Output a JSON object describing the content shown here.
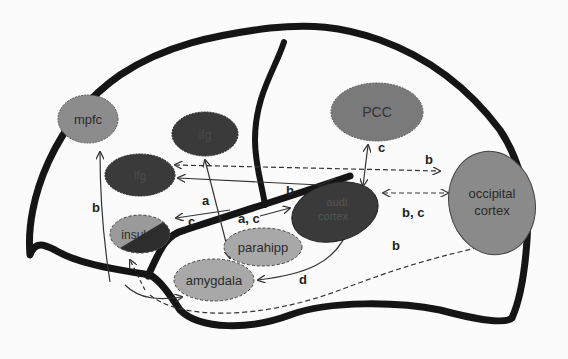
{
  "diagram": {
    "type": "brain-connectivity",
    "regions": {
      "mpfc": {
        "label": "mpfc",
        "fill": "#8c8c8c"
      },
      "ifg_top": {
        "label": "ifg",
        "fill": "#3a3a3a"
      },
      "lfg": {
        "label": "lfg",
        "fill": "#3a3a3a"
      },
      "pcc": {
        "label": "PCC",
        "fill": "#7a7a7a"
      },
      "audi_cortex_line1": {
        "label": "audi",
        "fill": "#3a3a3a"
      },
      "audi_cortex_line2": {
        "label": "cortex"
      },
      "occipital_line1": {
        "label": "occipital",
        "fill": "#8a8a8a"
      },
      "occipital_line2": {
        "label": "cortex"
      },
      "insula": {
        "label": "insula",
        "fill": "#9a9a9a"
      },
      "parahipp": {
        "label": "parahipp",
        "fill": "#a8a8a8"
      },
      "amygdala": {
        "label": "amygdala",
        "fill": "#a8a8a8"
      }
    },
    "edge_labels": {
      "b_left": "b",
      "a_left": "a",
      "b_mid": "b",
      "b_top_right": "b",
      "c_pcc": "c",
      "bc_right": "b, c",
      "ac_mid": "a, c",
      "c_insula": "c",
      "d_bottom": "d",
      "b_bottom": "b"
    }
  }
}
